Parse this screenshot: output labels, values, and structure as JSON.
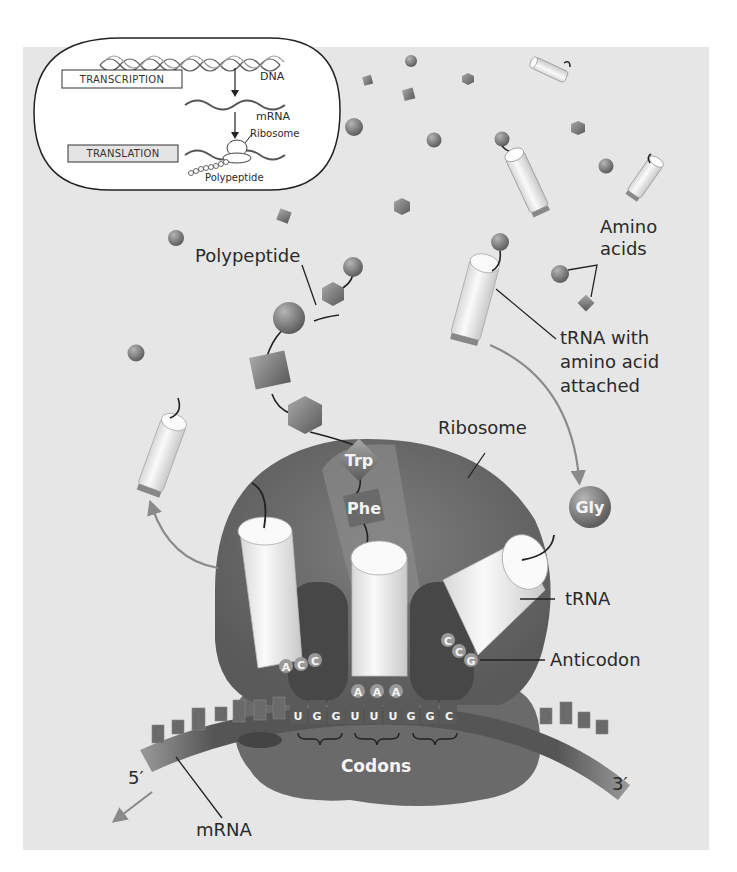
{
  "figure": {
    "type": "biology-diagram",
    "colors": {
      "background": "#e6e6e6",
      "ribosome": "#6f6f6f",
      "ribosome_dark": "#4f4f4f",
      "trna_body": "#f2f2f2",
      "amino_acid": "#7a7a7a",
      "mrna": "#5c5c5c",
      "leader": "#222222",
      "arrow": "#8a8a8a"
    }
  },
  "inset": {
    "steps": [
      {
        "label": "TRANSCRIPTION"
      },
      {
        "label": "TRANSLATION"
      }
    ],
    "molecules": [
      {
        "label": "DNA"
      },
      {
        "label": "mRNA"
      },
      {
        "label": "Ribosome"
      },
      {
        "label": "Polypeptide"
      }
    ]
  },
  "labels": {
    "polypeptide": "Polypeptide",
    "amino_acids_line1": "Amino",
    "amino_acids_line2": "acids",
    "trna_attached_line1": "tRNA with",
    "trna_attached_line2": "amino acid",
    "trna_attached_line3": "attached",
    "ribosome": "Ribosome",
    "trna": "tRNA",
    "anticodon": "Anticodon",
    "codons": "Codons",
    "mrna": "mRNA",
    "five_prime": "5′",
    "three_prime": "3′"
  },
  "amino_acids": {
    "trp": "Trp",
    "phe": "Phe",
    "gly": "Gly"
  },
  "trnas": [
    {
      "position": "exit",
      "anticodon": [
        "A",
        "C",
        "C"
      ]
    },
    {
      "position": "P-site",
      "anticodon": [
        "A",
        "A",
        "A"
      ]
    },
    {
      "position": "A-site",
      "anticodon": [
        "C",
        "C",
        "G"
      ]
    }
  ],
  "mrna_codons": [
    {
      "bases": [
        "U",
        "G",
        "G"
      ]
    },
    {
      "bases": [
        "U",
        "U",
        "U"
      ]
    },
    {
      "bases": [
        "G",
        "G",
        "C"
      ]
    }
  ]
}
